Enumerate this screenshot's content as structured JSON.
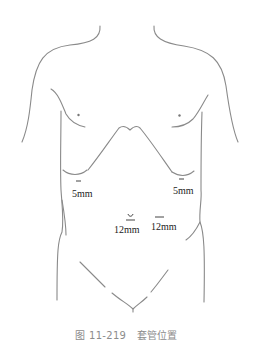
{
  "figure": {
    "caption": "图 11-219　套管位置"
  },
  "ports": [
    {
      "id": "left-5mm",
      "label": "5mm"
    },
    {
      "id": "right-5mm",
      "label": "5mm"
    },
    {
      "id": "umbilical-12mm",
      "label": "12mm"
    },
    {
      "id": "right-12mm",
      "label": "12mm"
    }
  ],
  "colors": {
    "outline": "#8a8a8a",
    "label": "#222222",
    "caption": "#8c8c8c"
  }
}
